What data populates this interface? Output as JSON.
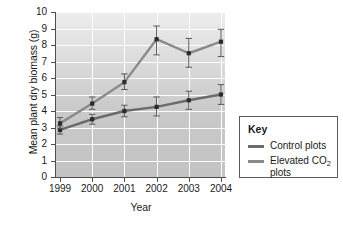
{
  "chart_data": {
    "type": "line",
    "title": "",
    "xlabel": "Year",
    "ylabel": "Mean plant dry biomass (g)",
    "categories": [
      "1999",
      "2000",
      "2001",
      "2002",
      "2003",
      "2004"
    ],
    "x": [
      1999,
      2000,
      2001,
      2002,
      2003,
      2004
    ],
    "ylim": [
      0,
      10
    ],
    "yticks": [
      "0",
      "1",
      "2",
      "3",
      "4",
      "5",
      "6",
      "7",
      "8",
      "9",
      "10"
    ],
    "grid": "white gridlines, horizontal and vertical",
    "legend_position": "right, outside plot",
    "series": [
      {
        "name": "Control plots",
        "color": "#6b6b6b",
        "values": [
          2.85,
          3.5,
          4.0,
          4.25,
          4.65,
          5.0
        ],
        "error_low": [
          2.6,
          3.2,
          3.65,
          3.7,
          4.1,
          4.4
        ],
        "error_high": [
          3.1,
          3.8,
          4.35,
          4.85,
          5.2,
          5.6
        ]
      },
      {
        "name": "Elevated CO2 plots",
        "color": "#8a8a8a",
        "values": [
          3.25,
          4.45,
          5.75,
          8.35,
          7.5,
          8.2
        ],
        "error_low": [
          2.95,
          4.1,
          5.3,
          7.4,
          6.65,
          7.3
        ],
        "error_high": [
          3.6,
          4.85,
          6.25,
          9.15,
          8.4,
          8.95
        ]
      }
    ]
  },
  "legend": {
    "title": "Key",
    "items": [
      {
        "label": "Control plots",
        "label_prefix": "Control plots",
        "label_sub": "",
        "label_suffix": "",
        "color": "#6b6b6b"
      },
      {
        "label": "Elevated CO2 plots",
        "label_prefix": "Elevated CO",
        "label_sub": "2",
        "label_suffix": " plots",
        "color": "#8a8a8a"
      }
    ]
  }
}
